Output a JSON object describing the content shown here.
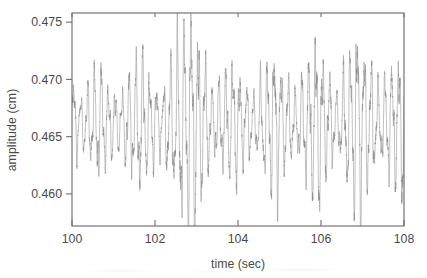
{
  "figure": {
    "type": "line-plot",
    "background": "#ffffff",
    "line_color": "#8d8d8d",
    "axis_color": "#6e6e6e",
    "text_color": "#4a4a4a"
  },
  "chart_data": {
    "type": "line",
    "title": "",
    "xlabel": "time  (sec)",
    "ylabel": "amplitude  (cm)",
    "xlim": [
      100,
      108
    ],
    "ylim": [
      0.4572,
      0.4758
    ],
    "xticks": [
      100,
      102,
      104,
      106,
      108
    ],
    "xticklabels": [
      "100",
      "102",
      "104",
      "106",
      "108"
    ],
    "yticks": [
      0.46,
      0.465,
      0.47,
      0.475
    ],
    "yticklabels": [
      "0.460",
      "0.465",
      "0.470",
      "0.475"
    ],
    "grid": false,
    "legend": null,
    "tick_direction": {
      "x": "in",
      "y": "out"
    },
    "frame": "full-box",
    "series": [
      {
        "name": "amplitude",
        "description": "High-frequency oscillation with beating amplitude envelope",
        "mean_level": 0.4662,
        "carrier_frequency_hz": 6.0,
        "envelope_description": "Amplitude envelope modulated by slow beats; maxima near t=100.6, 101.6, 102.9, 104.3, 105.4, 106.4, 107.5; minima near t=100.2, 101.1, 102.2, 103.5, 104.9, 105.9, 107.0",
        "peak_max": {
          "t": 102.9,
          "value": 0.4748
        },
        "peak_min": {
          "t": 102.95,
          "value": 0.4585
        },
        "envelope_times": [
          100.0,
          100.2,
          100.45,
          100.65,
          100.9,
          101.15,
          101.4,
          101.65,
          101.9,
          102.15,
          102.4,
          102.65,
          102.9,
          103.15,
          103.4,
          103.65,
          103.9,
          104.15,
          104.4,
          104.65,
          104.9,
          105.15,
          105.4,
          105.65,
          105.9,
          106.15,
          106.4,
          106.65,
          106.9,
          107.15,
          107.4,
          107.65,
          108.0
        ],
        "envelope_values": [
          0.0034,
          0.0018,
          0.003,
          0.0043,
          0.0026,
          0.002,
          0.0037,
          0.005,
          0.0032,
          0.0022,
          0.0046,
          0.0068,
          0.0084,
          0.0052,
          0.0024,
          0.0036,
          0.0044,
          0.003,
          0.0021,
          0.004,
          0.0056,
          0.0034,
          0.0022,
          0.0042,
          0.0062,
          0.0038,
          0.002,
          0.0048,
          0.0074,
          0.0046,
          0.0026,
          0.004,
          0.0052
        ]
      }
    ]
  }
}
